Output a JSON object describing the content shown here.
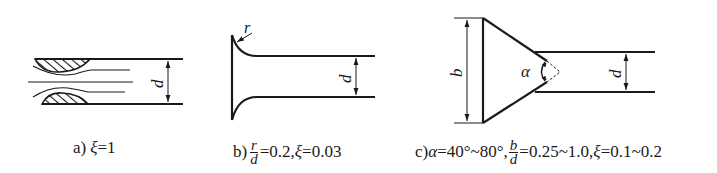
{
  "figures": [
    {
      "id": "a",
      "description": "sharp-edged pipe inlet with vena contracta separation",
      "dimension_label": "d",
      "caption": {
        "prefix": "a)",
        "symbol": "ξ",
        "text": "=1"
      }
    },
    {
      "id": "b",
      "description": "rounded (bell-mouth) pipe inlet with radius r",
      "radius_label": "r",
      "dimension_label": "d",
      "caption": {
        "prefix": "b)",
        "fraction_num": "r",
        "fraction_den": "d",
        "text1": "=0.2,",
        "symbol": "ξ",
        "text2": "=0.03"
      }
    },
    {
      "id": "c",
      "description": "conical pipe inlet with cone angle alpha and length b",
      "length_label": "b",
      "angle_label": "α",
      "dimension_label": "d",
      "caption": {
        "prefix": "c)",
        "symbol_alpha": "α",
        "text1": "=40°~80°,",
        "fraction_num": "b",
        "fraction_den": "d",
        "text2": "=0.25~1.0,",
        "symbol": "ξ",
        "text3": "=0.1~0.2"
      }
    }
  ],
  "colors": {
    "stroke": "#1a1a1a",
    "background": "#ffffff"
  }
}
